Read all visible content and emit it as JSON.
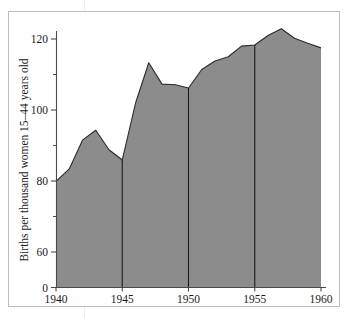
{
  "figure": {
    "background_color": "#ffffff",
    "frame_color": "#b9bcc0",
    "axis_color": "#4a4a4a",
    "area_fill_color": "#8c8c8c",
    "area_line_color": "#2b2b2b",
    "divider_color": "#1c1c1c"
  },
  "chart_data": {
    "type": "area",
    "title": "",
    "xlabel": "",
    "ylabel": "Births per thousand women 15–44 years old",
    "x": [
      1940,
      1941,
      1942,
      1943,
      1944,
      1945,
      1946,
      1947,
      1948,
      1949,
      1950,
      1951,
      1952,
      1953,
      1954,
      1955,
      1956,
      1957,
      1958,
      1959,
      1960
    ],
    "values": [
      79.9,
      83.4,
      91.5,
      94.3,
      88.8,
      85.9,
      101.9,
      113.3,
      107.3,
      107.1,
      106.2,
      111.4,
      113.8,
      115.0,
      118.0,
      118.3,
      121.0,
      122.9,
      120.2,
      118.8,
      117.5
    ],
    "xlim": [
      1940,
      1960
    ],
    "ylim": [
      0,
      127
    ],
    "y_axis_break": true,
    "y_axis_break_note": "axis compressed between 0 and 60",
    "xticks": [
      1940,
      1945,
      1950,
      1955,
      1960
    ],
    "xtick_labels": [
      "1940",
      "1945",
      "1950",
      "1955",
      "1960"
    ],
    "yticks": [
      0,
      60,
      80,
      100,
      120
    ],
    "ytick_labels": [
      "0",
      "60",
      "80",
      "100",
      "120"
    ],
    "y_minor_ticks": [
      70,
      90,
      110
    ],
    "grid": false,
    "legend": null,
    "vertical_dividers": [
      1945,
      1950,
      1955
    ],
    "series": [
      {
        "name": "Births per thousand women 15-44 years old",
        "values": [
          79.9,
          83.4,
          91.5,
          94.3,
          88.8,
          85.9,
          101.9,
          113.3,
          107.3,
          107.1,
          106.2,
          111.4,
          113.8,
          115.0,
          118.0,
          118.3,
          121.0,
          122.9,
          120.2,
          118.8,
          117.5
        ]
      }
    ]
  },
  "axes": {
    "y_title": "Births per thousand women 15–44 years old",
    "y_labels": [
      "120",
      "100",
      "80",
      "60",
      "0"
    ],
    "x_labels": [
      "1940",
      "1945",
      "1950",
      "1955",
      "1960"
    ]
  }
}
